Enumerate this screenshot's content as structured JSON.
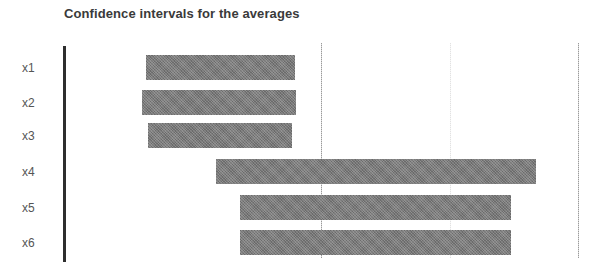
{
  "chart_data": {
    "type": "bar",
    "orientation": "horizontal",
    "subtype": "floating-range",
    "title": "Confidence intervals for the averages",
    "xlabel": "",
    "ylabel": "",
    "categories": [
      "x1",
      "x2",
      "x3",
      "x4",
      "x5",
      "x6"
    ],
    "series": [
      {
        "name": "confidence interval",
        "low": [
          0.64,
          0.61,
          0.65,
          1.18,
          1.37,
          1.37
        ],
        "high": [
          1.8,
          1.81,
          1.77,
          3.67,
          3.48,
          3.48
        ]
      }
    ],
    "xlim": [
      0,
      4
    ],
    "gridlines_x": [
      2,
      3,
      4
    ],
    "x_tick_labels_visible": false,
    "grid": true,
    "legend": "none",
    "colors": {
      "bar": "#7a7a7a",
      "axis": "#2e2e2e",
      "grid": "#9a9a9a",
      "label": "#555555"
    }
  },
  "layout": {
    "plot_left_px": 64,
    "px_per_unit": 128.5,
    "bar_tops_px": [
      55,
      90,
      123,
      159,
      195,
      230
    ],
    "label_tops_px": [
      61,
      96,
      129,
      165,
      201,
      236
    ]
  }
}
